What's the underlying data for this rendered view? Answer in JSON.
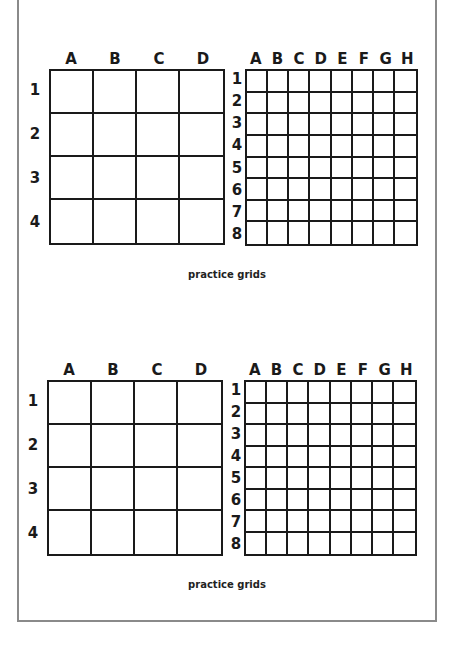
{
  "page": {
    "frame_color": "#8a8a8a",
    "grid_line_color": "#1a1a1a"
  },
  "sections": [
    {
      "caption": "practice grids",
      "grid_4x4": {
        "columns": [
          "A",
          "B",
          "C",
          "D"
        ],
        "rows": [
          "1",
          "2",
          "3",
          "4"
        ]
      },
      "grid_8x8": {
        "columns": [
          "A",
          "B",
          "C",
          "D",
          "E",
          "F",
          "G",
          "H"
        ],
        "rows": [
          "1",
          "2",
          "3",
          "4",
          "5",
          "6",
          "7",
          "8"
        ]
      }
    },
    {
      "caption": "practice grids",
      "grid_4x4": {
        "columns": [
          "A",
          "B",
          "C",
          "D"
        ],
        "rows": [
          "1",
          "2",
          "3",
          "4"
        ]
      },
      "grid_8x8": {
        "columns": [
          "A",
          "B",
          "C",
          "D",
          "E",
          "F",
          "G",
          "H"
        ],
        "rows": [
          "1",
          "2",
          "3",
          "4",
          "5",
          "6",
          "7",
          "8"
        ]
      }
    }
  ]
}
